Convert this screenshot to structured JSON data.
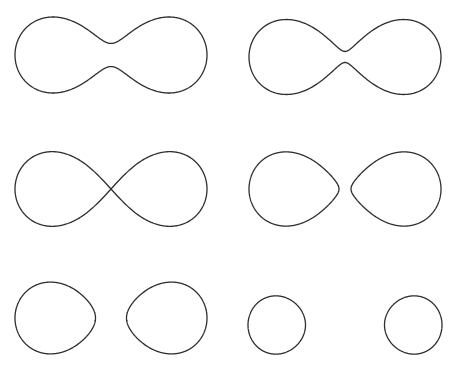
{
  "figure": {
    "stroke_color": "#2e2e2e",
    "background": "#ffffff",
    "y_scale": 1.1
  },
  "chart_data": {
    "type": "diagram",
    "title": "",
    "layout": {
      "rows": 3,
      "cols": 2
    },
    "equation": "(x^2+y^2)^2 - 2c^2(x^2-y^2) = a^4 - c^4",
    "panels": [
      {
        "name": "panel-top-left",
        "cx": 111,
        "cy": 55,
        "a2": 4663,
        "c2": 4553,
        "shape": "single-loop-wide-waist"
      },
      {
        "name": "panel-top-right",
        "cx": 345,
        "cy": 57,
        "a2": 4620,
        "c2": 4595,
        "shape": "single-loop-narrow-waist"
      },
      {
        "name": "panel-middle-left",
        "cx": 111,
        "cy": 189,
        "a2": 4608,
        "c2": 4608,
        "shape": "lemniscate"
      },
      {
        "name": "panel-middle-right",
        "cx": 345,
        "cy": 189,
        "a2": 4590,
        "c2": 4626,
        "shape": "two-loops-near"
      },
      {
        "name": "panel-bottom-left",
        "cx": 111,
        "cy": 318,
        "a2": 4488,
        "c2": 4728,
        "shape": "two-loops-apart"
      },
      {
        "name": "panel-bottom-right",
        "cx": 345,
        "cy": 325,
        "a2": 3925,
        "c2": 5485,
        "shape": "two-small-ovals"
      }
    ]
  }
}
